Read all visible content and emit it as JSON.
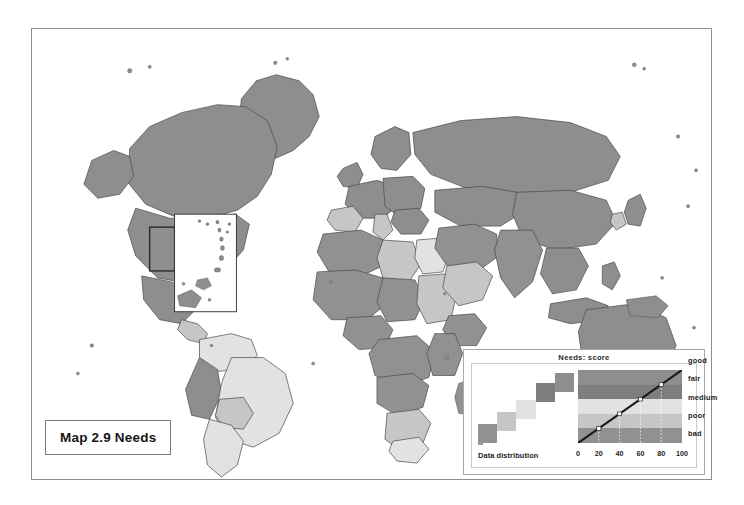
{
  "map": {
    "title": "Map 2.9 Needs",
    "frame": {
      "border_color": "#8d8d8d",
      "background": "#ffffff"
    },
    "inset": {
      "name": "caribbean-inset",
      "visible": true
    }
  },
  "legend": {
    "title": "Needs: score",
    "distribution_label": "Data distribution",
    "classes": [
      {
        "label": "good",
        "color": "#8e8e8e",
        "range": [
          80,
          100
        ]
      },
      {
        "label": "fair",
        "color": "#7e7e7e",
        "range": [
          60,
          80
        ]
      },
      {
        "label": "medium",
        "color": "#e2e2e2",
        "range": [
          40,
          60
        ]
      },
      {
        "label": "poor",
        "color": "#c6c6c6",
        "range": [
          20,
          40
        ]
      },
      {
        "label": "bad",
        "color": "#919191",
        "range": [
          0,
          20
        ]
      }
    ],
    "axis": {
      "ticks": [
        "0",
        "20",
        "40",
        "60",
        "80",
        "100"
      ],
      "min": 0,
      "max": 100
    }
  },
  "chart_data": {
    "type": "line",
    "title": "Needs: score",
    "xlabel": "",
    "ylabel": "",
    "xlim": [
      0,
      100
    ],
    "ylim": [
      0,
      100
    ],
    "grid": false,
    "legend_position": "right",
    "x": [
      0,
      20,
      40,
      60,
      80,
      100
    ],
    "y": [
      0,
      20,
      40,
      60,
      80,
      100
    ],
    "markers": [
      {
        "x": 20,
        "y": 20
      },
      {
        "x": 40,
        "y": 40
      },
      {
        "x": 60,
        "y": 60
      },
      {
        "x": 80,
        "y": 80
      }
    ],
    "bands": [
      {
        "label": "bad",
        "from": 0,
        "to": 20,
        "color": "#919191"
      },
      {
        "label": "poor",
        "from": 20,
        "to": 40,
        "color": "#c6c6c6"
      },
      {
        "label": "medium",
        "from": 40,
        "to": 60,
        "color": "#e2e2e2"
      },
      {
        "label": "fair",
        "from": 60,
        "to": 80,
        "color": "#7e7e7e"
      },
      {
        "label": "good",
        "from": 80,
        "to": 100,
        "color": "#8e8e8e"
      }
    ],
    "distribution": {
      "type": "bar",
      "label": "Data distribution",
      "categories": [
        "bad",
        "poor",
        "medium",
        "fair",
        "good"
      ],
      "values": [
        22,
        38,
        55,
        78,
        92
      ],
      "colors": [
        "#919191",
        "#c6c6c6",
        "#e2e2e2",
        "#7e7e7e",
        "#8e8e8e"
      ]
    }
  },
  "regions": {
    "palette": {
      "bad": "#919191",
      "poor": "#c6c6c6",
      "medium": "#e2e2e2",
      "fair": "#7e7e7e",
      "good": "#8e8e8e",
      "nodata": "#ffffff",
      "outline": "#4a4a4a"
    }
  }
}
